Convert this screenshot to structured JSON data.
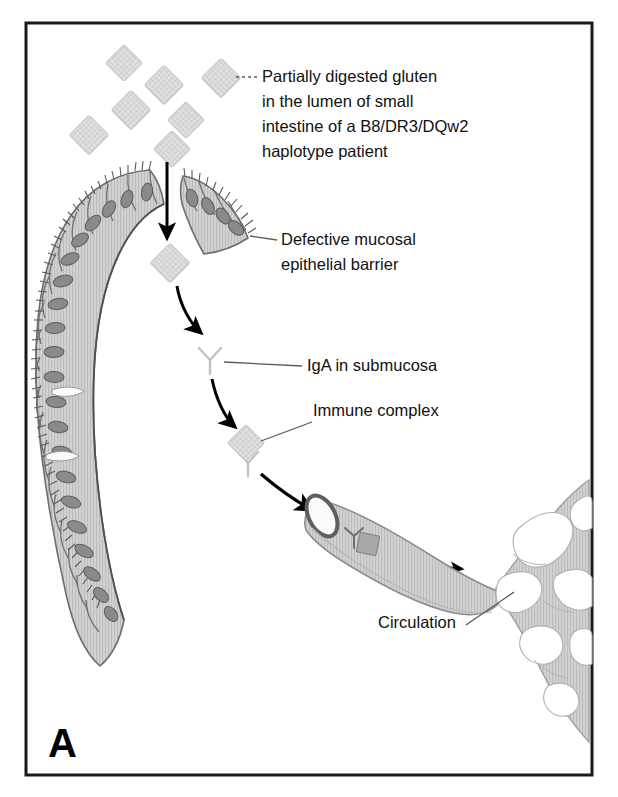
{
  "figure": {
    "panel_letter": "A",
    "frame_color": "#1a1a1a",
    "background_color": "#ffffff"
  },
  "palette": {
    "gluten_particle": "#d9d9d9",
    "gluten_particle_stroke": "#bdbdbd",
    "epithelium_fill": "#cfcfcf",
    "epithelium_stroke": "#6e6e6e",
    "nucleus_fill": "#8a8a8a",
    "nucleus_stroke": "#5c5c5c",
    "iga_stroke": "#c2c2c2",
    "vessel_fill": "#d2d2d2",
    "vessel_stroke": "#8c8c8c",
    "vessel_rim": "#5f5f5f",
    "capillary_fill": "#cfcfcf",
    "arrow_color": "#000000",
    "leader_color": "#5a5a5a",
    "text_color": "#111111"
  },
  "labels": [
    {
      "id": "gluten",
      "name": "label-partially-digested-gluten",
      "lines": [
        "Partially digested gluten",
        "in the lumen of small",
        "intestine of a B8/DR3/DQw2",
        "haplotype patient"
      ],
      "x": 262,
      "y": 82,
      "line_height": 25,
      "leader_style": "dotted"
    },
    {
      "id": "barrier",
      "name": "label-defective-mucosal-epithelial-barrier",
      "lines": [
        "Defective mucosal",
        "epithelial barrier"
      ],
      "x": 281,
      "y": 245,
      "line_height": 25,
      "leader_style": "solid"
    },
    {
      "id": "iga",
      "name": "label-iga-in-submucosa",
      "lines": [
        "IgA in submucosa"
      ],
      "x": 307,
      "y": 371,
      "line_height": 25,
      "leader_style": "solid"
    },
    {
      "id": "immune-complex",
      "name": "label-immune-complex",
      "lines": [
        "Immune complex"
      ],
      "x": 313,
      "y": 416,
      "line_height": 25,
      "leader_style": "solid"
    },
    {
      "id": "circulation",
      "name": "label-circulation",
      "lines": [
        "Circulation"
      ],
      "x": 378,
      "y": 628,
      "line_height": 25,
      "leader_style": "solid"
    }
  ],
  "gluten_particles": [
    {
      "cx": 124,
      "cy": 63,
      "r": 13
    },
    {
      "cx": 164,
      "cy": 85,
      "r": 14
    },
    {
      "cx": 221,
      "cy": 78,
      "r": 14
    },
    {
      "cx": 131,
      "cy": 110,
      "r": 14
    },
    {
      "cx": 186,
      "cy": 120,
      "r": 13
    },
    {
      "cx": 89,
      "cy": 135,
      "r": 14
    },
    {
      "cx": 172,
      "cy": 149,
      "r": 13
    },
    {
      "cx": 170,
      "cy": 263,
      "r": 14
    }
  ],
  "immune_complex_particles": [
    {
      "cx": 246,
      "cy": 443,
      "r": 13,
      "name": "immune-complex-particle"
    },
    {
      "cx": 367,
      "cy": 543,
      "r": 10,
      "name": "immune-complex-in-vessel"
    }
  ],
  "antibodies": [
    {
      "cx": 210,
      "cy": 359,
      "scale": 1.0,
      "name": "iga-antibody"
    },
    {
      "cx": 248,
      "cy": 462,
      "scale": 0.95,
      "name": "iga-antibody-bound"
    },
    {
      "cx": 354,
      "cy": 536,
      "scale": 0.8,
      "name": "iga-antibody-in-vessel"
    }
  ],
  "arrows": [
    {
      "name": "arrow-gluten-through-epithelium",
      "type": "straight",
      "x1": 167,
      "y1": 165,
      "x2": 167,
      "y2": 243
    },
    {
      "name": "arrow-gluten-to-iga",
      "type": "curved",
      "x1": 178,
      "y1": 285,
      "x2": 204,
      "y2": 336,
      "cx": 182,
      "cy": 316
    },
    {
      "name": "arrow-iga-to-complex",
      "type": "curved",
      "x1": 213,
      "y1": 378,
      "x2": 237,
      "y2": 429,
      "cx": 218,
      "cy": 409
    },
    {
      "name": "arrow-complex-to-vessel",
      "type": "curved",
      "x1": 262,
      "y1": 473,
      "x2": 318,
      "y2": 513,
      "cx": 283,
      "cy": 495
    },
    {
      "name": "arrow-flow-in-vessel",
      "type": "straight",
      "x1": 389,
      "y1": 561,
      "x2": 466,
      "y2": 570
    }
  ],
  "structures": {
    "villus_name": "intestinal-villus-epithelium",
    "vessel_name": "blood-vessel",
    "capillary_name": "capillary-network",
    "lumen_gap_name": "epithelial-barrier-defect"
  }
}
